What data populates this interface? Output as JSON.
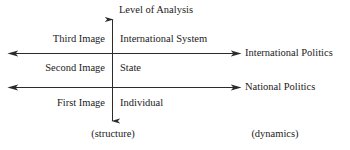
{
  "diagram": {
    "axis_title": "Level of Analysis",
    "vertical_axis": {
      "name": "level-of-analysis-axis",
      "top_arrow": true,
      "bottom_arrow": true
    },
    "rows": [
      {
        "image_label": "Third Image",
        "level_label": "International System"
      },
      {
        "image_label": "Second Image",
        "level_label": "State"
      },
      {
        "image_label": "First Image",
        "level_label": "Individual"
      }
    ],
    "horizontal_arrows": [
      {
        "name": "international-politics-arrow",
        "end_label": "International Politics"
      },
      {
        "name": "national-politics-arrow",
        "end_label": "National Politics"
      }
    ],
    "footnotes": {
      "left": "(structure)",
      "right": "(dynamics)"
    },
    "colors": {
      "background": "#ffffff",
      "ink": "#1b1b1b",
      "rule": "#2b2b2b"
    }
  }
}
